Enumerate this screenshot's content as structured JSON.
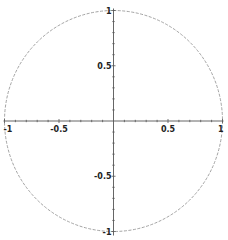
{
  "chart_data": {
    "type": "line",
    "title": "",
    "xlabel": "",
    "ylabel": "",
    "xlim": [
      -1,
      1
    ],
    "ylim": [
      -1,
      1
    ],
    "grid": false,
    "legend": null,
    "axes_style": "centered at origin",
    "series": [
      {
        "name": "unit circle",
        "equation": "x^2 + y^2 = 1",
        "color": "#999999",
        "style": "dashed"
      }
    ],
    "x_ticks": [
      -1,
      -0.5,
      0.5,
      1
    ],
    "y_ticks": [
      1,
      0.5,
      -0.5,
      -1
    ],
    "x_tick_labels": [
      "-1",
      "-0.5",
      "0.5",
      "1"
    ],
    "y_tick_labels": [
      "1",
      "0.5",
      "-0.5",
      "-1"
    ],
    "minor_tick_step": 0.1
  },
  "colors": {
    "axis": "#555555",
    "curve": "#999999",
    "label": "#222222",
    "background": "#ffffff"
  }
}
